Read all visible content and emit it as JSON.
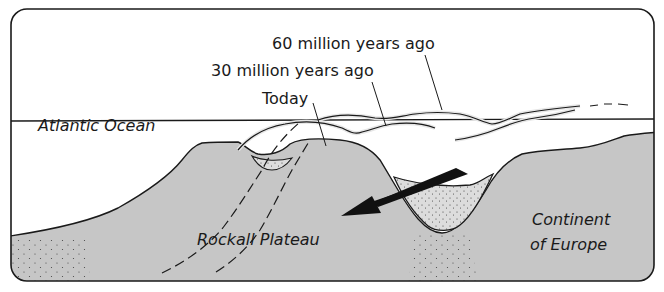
{
  "diagram": {
    "labels": {
      "ocean": "Atlantic Ocean",
      "plateau": "Rockall Plateau",
      "continent_line1": "Continent",
      "continent_line2": "of Europe"
    },
    "time_labels": {
      "sixty": "60 million years ago",
      "thirty": "30 million years ago",
      "today": "Today"
    },
    "colors": {
      "land_fill": "#c6c6c6",
      "outline": "#1a1a1a",
      "sediment_fill": "#d9d9d9",
      "background": "#ffffff",
      "highlight": "#e6e6e6"
    }
  }
}
